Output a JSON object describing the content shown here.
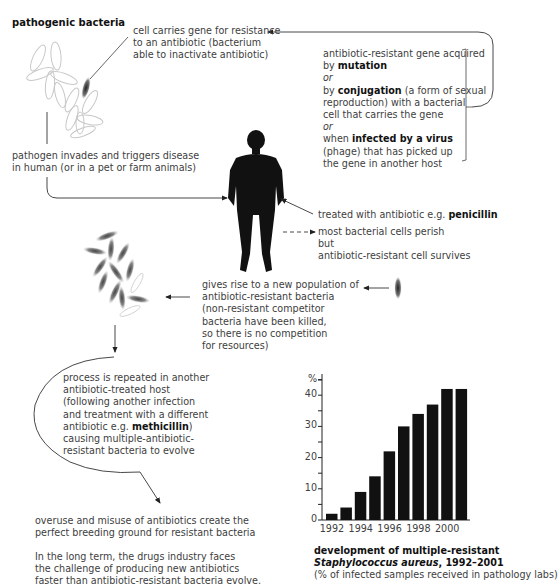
{
  "title": "pathogenic bacteria",
  "labels": {
    "resistant_cell": [
      "cell carries gene for resistance",
      "to an antibiotic (bacterium",
      "able to inactivate antibiotic)"
    ],
    "gene_acquired": {
      "l1": "antibiotic-resistant gene acquired",
      "l2_pre": "by ",
      "l2_bold": "mutation",
      "l3": "or",
      "l4_pre": "by ",
      "l4_bold": "conjugation",
      "l4_post": " (a form of sexual",
      "l5": "reproduction) with a bacterial",
      "l6": "cell that carries the gene",
      "l7": "or",
      "l8_pre": "when ",
      "l8_bold": "infected by a virus",
      "l9": "(phage) that has picked up",
      "l10": "the gene in another host"
    },
    "pathogen_invades": [
      "pathogen invades and triggers disease",
      "in human (or in a pet or farm animals)"
    ],
    "treated": {
      "pre": "treated with antibiotic e.g. ",
      "bold": "penicillin"
    },
    "perish": [
      "most bacterial cells perish",
      "but",
      "antibiotic-resistant cell survives"
    ],
    "new_population": [
      "gives rise to a new population of",
      "antibiotic-resistant bacteria",
      "(non-resistant competitor",
      "bacteria have been killed,",
      "so there is no competition",
      "for resources)"
    ],
    "process_repeated": {
      "l1": "process is repeated in another",
      "l2": "antibiotic-treated host",
      "l3": "(following another infection",
      "l4": "and treatment with a different",
      "l5_pre": "antibiotic e.g. ",
      "l5_bold": "methicillin",
      "l5_post": ")",
      "l6": "causing multiple-antibiotic-",
      "l7": "resistant bacteria to evolve"
    },
    "overuse": [
      "overuse and misuse of antibiotics create the",
      "perfect breeding ground for resistant bacteria"
    ],
    "long_term": [
      "In the long term, the drugs industry faces",
      "the challenge of producing new antibiotics",
      "faster than antibiotic-resistant bacteria evolve."
    ]
  },
  "icons": {
    "bacteria_cluster": "bacteria-cluster",
    "resistant_bacterium": "resistant-bacterium",
    "human": "human-silhouette"
  },
  "chart_caption": {
    "l1": "development of multiple-resistant",
    "l2_italic": "Staphylococcus aureus",
    "l2_post": ", 1992–2001",
    "l3": "(% of infected samples received in pathology labs)"
  },
  "chart_data": {
    "type": "bar",
    "title": "development of multiple-resistant Staphylococcus aureus, 1992–2001",
    "subtitle": "(% of infected samples received in pathology labs)",
    "xlabel": "",
    "ylabel": "%",
    "categories": [
      "1992",
      "1993",
      "1994",
      "1995",
      "1996",
      "1997",
      "1998",
      "1999",
      "2000",
      "2001"
    ],
    "values": [
      2,
      4,
      9,
      14,
      22,
      30,
      34,
      37,
      42,
      42
    ],
    "x_tick_labels": [
      "1992",
      "1994",
      "1996",
      "1998",
      "2000"
    ],
    "y_ticks": [
      "0",
      "10",
      "20",
      "30",
      "40"
    ],
    "ylim": [
      0,
      45
    ],
    "grid": false,
    "bar_color": "#111111"
  }
}
